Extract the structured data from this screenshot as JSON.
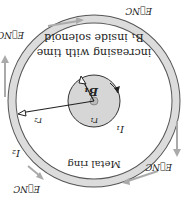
{
  "figure": {
    "rotation_deg": 180,
    "labels": {
      "b1_caption_line1": "B₁ inside solenoid",
      "b1_caption_line2": "increasing with time",
      "b1": "B₁",
      "r1": "r₁",
      "r2": "r₂",
      "i1": "I₁",
      "i2": "I₂",
      "ring": "Metal ring",
      "enc": "E⃗NC"
    },
    "colors": {
      "ring": "#d9d9d9",
      "solenoid": "#d6d6d6",
      "arrow": "#a8a8a8",
      "line": "#222222"
    }
  }
}
